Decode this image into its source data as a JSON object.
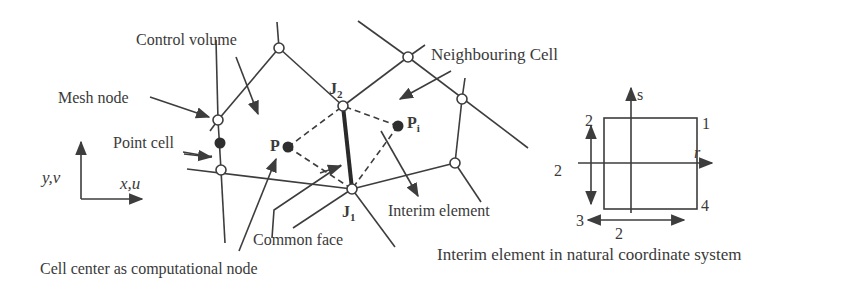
{
  "diagram": {
    "labels": {
      "control_volume": "Control volume",
      "mesh_node": "Mesh node",
      "neighbouring_cell": "Neighbouring Cell",
      "point_cell": "Point cell",
      "p": "P",
      "pi_main": "P",
      "pi_sub": "i",
      "j2_main": "J",
      "j2_sub": "2",
      "j1_main": "J",
      "j1_sub": "1",
      "interim_element": "Interim element",
      "common_face": "Common face",
      "cell_center": "Cell center as computational node"
    },
    "axes": {
      "y_label": "y,v",
      "x_label": "x,u"
    },
    "natural_element": {
      "caption": "Interim element in natural coordinate system",
      "s_axis": "s",
      "r_axis": "r",
      "corner_1": "1",
      "corner_2": "2",
      "corner_3": "3",
      "corner_4": "4",
      "height_dim": "2",
      "width_dim": "2"
    }
  }
}
